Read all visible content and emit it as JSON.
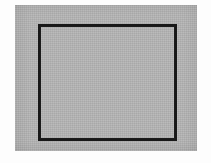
{
  "figure": {
    "title": "",
    "caption": "",
    "background": {
      "page_color": "#fdfdfd",
      "panel_color": "#b4b4b4"
    },
    "shapes": [
      {
        "name": "gray-panel",
        "kind": "rectangle",
        "fill": "#b4b4b4",
        "stroke": "none",
        "stroke_width": 0,
        "x": 15,
        "y": 5,
        "width": 182,
        "height": 146
      },
      {
        "name": "outlined-rectangle",
        "kind": "rectangle",
        "fill": "none",
        "stroke": "#181818",
        "stroke_width": 3,
        "x": 38,
        "y": 24,
        "width": 139,
        "height": 117
      }
    ],
    "labels": [],
    "annotations": []
  }
}
